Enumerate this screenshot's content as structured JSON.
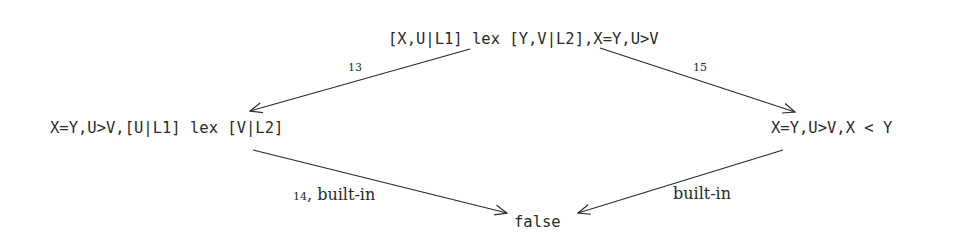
{
  "diagram": {
    "nodes": {
      "top": "[X,U|L1] lex [Y,V|L2],X=Y,U>V",
      "left": "X=Y,U>V,[U|L1] lex [V|L2]",
      "right": "X=Y,U>V,X < Y",
      "bottom": "false"
    },
    "edges": [
      {
        "from": "top",
        "to": "left",
        "rule": "13",
        "label": ""
      },
      {
        "from": "top",
        "to": "right",
        "rule": "15",
        "label": ""
      },
      {
        "from": "left",
        "to": "bottom",
        "rule": "14",
        "label": ", built-in"
      },
      {
        "from": "right",
        "to": "bottom",
        "rule": "",
        "label": "built-in"
      }
    ],
    "colors": {
      "ink": "#2a2a2a",
      "background": "#ffffff"
    }
  }
}
